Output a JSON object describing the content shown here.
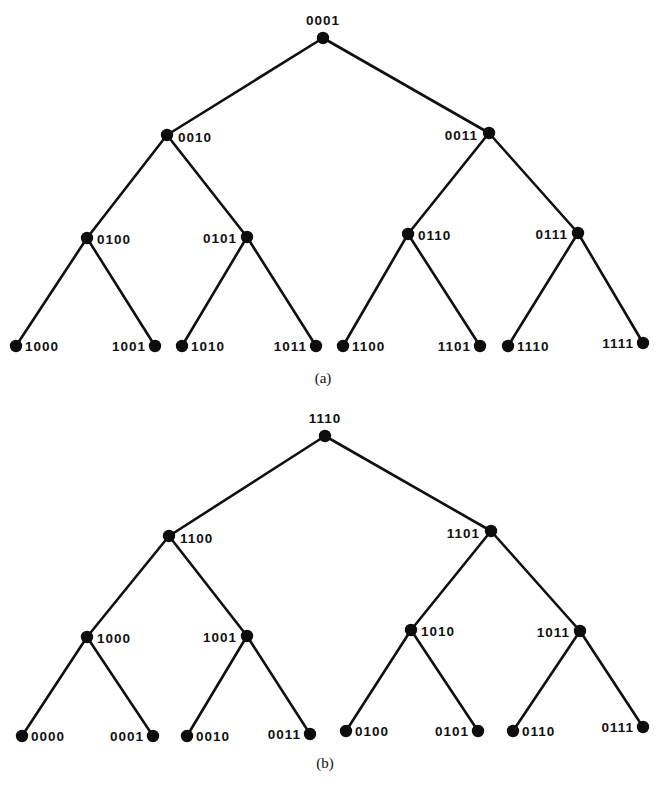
{
  "figure": {
    "background_color": "#ffffff",
    "node_color": "#0d0d0d",
    "edge_color": "#101010",
    "width": 656,
    "height": 785
  },
  "panels": [
    {
      "id": "panel-a",
      "caption": "(a)",
      "caption_x": 323,
      "caption_y": 378,
      "nodes": [
        {
          "label": "0001",
          "x": 323,
          "y": 38,
          "anchor": "top",
          "label_dx": 0,
          "label_dy": -11
        },
        {
          "label": "0010",
          "x": 167,
          "y": 135,
          "anchor": "right",
          "label_dx": 11,
          "label_dy": 3
        },
        {
          "label": "0011",
          "x": 489,
          "y": 133,
          "anchor": "left",
          "label_dx": -11,
          "label_dy": 3
        },
        {
          "label": "0100",
          "x": 87,
          "y": 238,
          "anchor": "right",
          "label_dx": 10,
          "label_dy": 2
        },
        {
          "label": "0101",
          "x": 247,
          "y": 237,
          "anchor": "left",
          "label_dx": -10,
          "label_dy": 2
        },
        {
          "label": "0110",
          "x": 408,
          "y": 234,
          "anchor": "right",
          "label_dx": 10,
          "label_dy": 2
        },
        {
          "label": "0111",
          "x": 578,
          "y": 233,
          "anchor": "left",
          "label_dx": -10,
          "label_dy": 2
        },
        {
          "label": "1000",
          "x": 16,
          "y": 346,
          "anchor": "right",
          "label_dx": 9,
          "label_dy": 1
        },
        {
          "label": "1001",
          "x": 155,
          "y": 346,
          "anchor": "left",
          "label_dx": -9,
          "label_dy": 1
        },
        {
          "label": "1010",
          "x": 182,
          "y": 346,
          "anchor": "right",
          "label_dx": 9,
          "label_dy": 1
        },
        {
          "label": "1011",
          "x": 316,
          "y": 346,
          "anchor": "left",
          "label_dx": -9,
          "label_dy": 1
        },
        {
          "label": "1100",
          "x": 343,
          "y": 346,
          "anchor": "right",
          "label_dx": 9,
          "label_dy": 1
        },
        {
          "label": "1101",
          "x": 480,
          "y": 346,
          "anchor": "left",
          "label_dx": -9,
          "label_dy": 1
        },
        {
          "label": "1110",
          "x": 508,
          "y": 346,
          "anchor": "right",
          "label_dx": 9,
          "label_dy": 1
        },
        {
          "label": "1111",
          "x": 643,
          "y": 343,
          "anchor": "left",
          "label_dx": -9,
          "label_dy": 1
        }
      ],
      "edges": [
        [
          "0001",
          "0010"
        ],
        [
          "0001",
          "0011"
        ],
        [
          "0010",
          "0100"
        ],
        [
          "0010",
          "0101"
        ],
        [
          "0011",
          "0110"
        ],
        [
          "0011",
          "0111"
        ],
        [
          "0100",
          "1000"
        ],
        [
          "0100",
          "1001"
        ],
        [
          "0101",
          "1010"
        ],
        [
          "0101",
          "1011"
        ],
        [
          "0110",
          "1100"
        ],
        [
          "0110",
          "1101"
        ],
        [
          "0111",
          "1110"
        ],
        [
          "0111",
          "1111"
        ]
      ]
    },
    {
      "id": "panel-b",
      "caption": "(b)",
      "caption_x": 325,
      "caption_y": 763,
      "nodes": [
        {
          "label": "1110",
          "x": 325,
          "y": 436,
          "anchor": "top",
          "label_dx": 0,
          "label_dy": -11
        },
        {
          "label": "1100",
          "x": 169,
          "y": 536,
          "anchor": "right",
          "label_dx": 11,
          "label_dy": 3
        },
        {
          "label": "1101",
          "x": 491,
          "y": 531,
          "anchor": "left",
          "label_dx": -11,
          "label_dy": 3
        },
        {
          "label": "1000",
          "x": 87,
          "y": 637,
          "anchor": "right",
          "label_dx": 10,
          "label_dy": 2
        },
        {
          "label": "1001",
          "x": 247,
          "y": 636,
          "anchor": "left",
          "label_dx": -10,
          "label_dy": 2
        },
        {
          "label": "1010",
          "x": 411,
          "y": 630,
          "anchor": "right",
          "label_dx": 10,
          "label_dy": 2
        },
        {
          "label": "1011",
          "x": 580,
          "y": 631,
          "anchor": "left",
          "label_dx": -10,
          "label_dy": 2
        },
        {
          "label": "0000",
          "x": 22,
          "y": 736,
          "anchor": "right",
          "label_dx": 9,
          "label_dy": 1
        },
        {
          "label": "0001",
          "x": 153,
          "y": 736,
          "anchor": "left",
          "label_dx": -9,
          "label_dy": 1
        },
        {
          "label": "0010",
          "x": 187,
          "y": 736,
          "anchor": "right",
          "label_dx": 9,
          "label_dy": 1
        },
        {
          "label": "0011",
          "x": 310,
          "y": 734,
          "anchor": "left",
          "label_dx": -9,
          "label_dy": 1
        },
        {
          "label": "0100",
          "x": 346,
          "y": 731,
          "anchor": "right",
          "label_dx": 9,
          "label_dy": 1
        },
        {
          "label": "0101",
          "x": 478,
          "y": 731,
          "anchor": "left",
          "label_dx": -9,
          "label_dy": 1
        },
        {
          "label": "0110",
          "x": 513,
          "y": 731,
          "anchor": "right",
          "label_dx": 9,
          "label_dy": 1
        },
        {
          "label": "0111",
          "x": 643,
          "y": 727,
          "anchor": "left",
          "label_dx": -9,
          "label_dy": 1
        }
      ],
      "edges": [
        [
          "1110",
          "1100"
        ],
        [
          "1110",
          "1101"
        ],
        [
          "1100",
          "1000"
        ],
        [
          "1100",
          "1001"
        ],
        [
          "1101",
          "1010"
        ],
        [
          "1101",
          "1011"
        ],
        [
          "1000",
          "0000"
        ],
        [
          "1000",
          "0001"
        ],
        [
          "1001",
          "0010"
        ],
        [
          "1001",
          "0011"
        ],
        [
          "1010",
          "0100"
        ],
        [
          "1010",
          "0101"
        ],
        [
          "1011",
          "0110"
        ],
        [
          "1011",
          "0111"
        ]
      ]
    }
  ]
}
